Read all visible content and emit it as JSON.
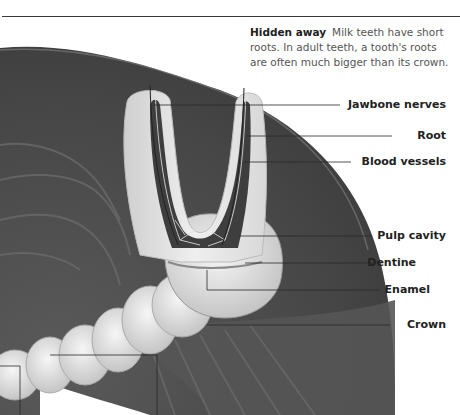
{
  "caption": {
    "title": "Hidden away",
    "body": "Milk teeth have short roots. In adult teeth, a tooth's roots are often much bigger than its crown."
  },
  "labels": [
    {
      "text": "Jawbone nerves",
      "y": 105
    },
    {
      "text": "Root",
      "y": 136
    },
    {
      "text": "Blood vessels",
      "y": 162
    },
    {
      "text": "Pulp cavity",
      "y": 236
    },
    {
      "text": "Dentine",
      "y": 263
    },
    {
      "text": "Enamel",
      "y": 290
    },
    {
      "text": "Crown",
      "y": 325
    }
  ],
  "colors": {
    "tissue_dark": "#4a4a4a",
    "tooth_light": "#e6e6e6",
    "leader_line": "#2a2a2a"
  }
}
